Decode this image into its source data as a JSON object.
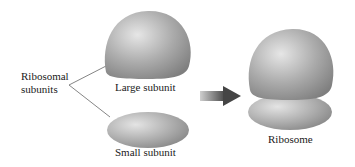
{
  "diagram": {
    "labels": {
      "group": [
        "Ribosomal",
        "subunits"
      ],
      "large": "Large subunit",
      "small": "Small subunit",
      "result": "Ribosome"
    },
    "colors": {
      "subunit_light": "#e2e2e2",
      "subunit_mid": "#a8a8a8",
      "subunit_dark": "#7e7e7e",
      "arrow_light": "#c9c9c9",
      "arrow_dark": "#4a4a4a",
      "connector": "#666666"
    }
  }
}
